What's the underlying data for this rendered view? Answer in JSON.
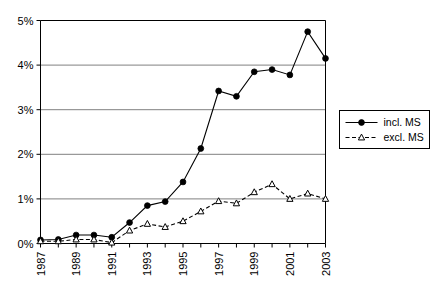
{
  "chart_data": {
    "type": "line",
    "title": "",
    "xlabel": "",
    "ylabel": "",
    "x": [
      1987,
      1988,
      1989,
      1990,
      1991,
      1992,
      1993,
      1994,
      1995,
      1996,
      1997,
      1998,
      1999,
      2000,
      2001,
      2002,
      2003
    ],
    "xlim": [
      1987,
      2003
    ],
    "ylim": [
      0,
      5
    ],
    "grid": true,
    "legend_position": "right",
    "ytick_labels": [
      "0%",
      "1%",
      "2%",
      "3%",
      "4%",
      "5%"
    ],
    "ytick_values": [
      0,
      1,
      2,
      3,
      4,
      5
    ],
    "xtick_values": [
      1987,
      1988,
      1989,
      1990,
      1991,
      1992,
      1993,
      1994,
      1995,
      1996,
      1997,
      1998,
      1999,
      2000,
      2001,
      2002,
      2003
    ],
    "xtick_labels": [
      "1987",
      "",
      "1989",
      "",
      "1991",
      "",
      "1993",
      "",
      "1995",
      "",
      "1997",
      "",
      "1999",
      "",
      "2001",
      "",
      "2003"
    ],
    "series": [
      {
        "name": "incl. MS",
        "marker": "filled-circle",
        "line_style": "solid",
        "color": "#000000",
        "values": [
          0.08,
          0.09,
          0.19,
          0.19,
          0.14,
          0.47,
          0.85,
          0.94,
          1.38,
          2.13,
          3.42,
          3.3,
          3.85,
          3.9,
          3.78,
          4.75,
          4.15
        ]
      },
      {
        "name": "excl. MS",
        "marker": "open-triangle",
        "line_style": "dashed",
        "color": "#000000",
        "values": [
          0.05,
          0.05,
          0.09,
          0.09,
          0.02,
          0.29,
          0.44,
          0.37,
          0.5,
          0.72,
          0.95,
          0.9,
          1.15,
          1.33,
          1.0,
          1.12,
          1.0
        ]
      }
    ]
  },
  "legend": {
    "entries": [
      {
        "label": "incl. MS"
      },
      {
        "label": "excl. MS"
      }
    ]
  }
}
